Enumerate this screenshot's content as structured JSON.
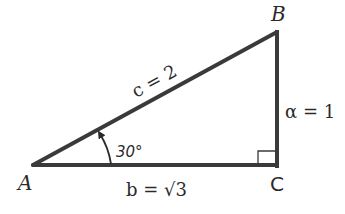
{
  "diagram": {
    "colors": {
      "stroke": "#3a3a3a",
      "text": "#2a2a2a",
      "background": "#ffffff"
    },
    "vertices": {
      "A": {
        "label": "A",
        "x": 33,
        "y": 165
      },
      "B": {
        "label": "B",
        "x": 277,
        "y": 32
      },
      "C": {
        "label": "C",
        "x": 277,
        "y": 165
      }
    },
    "sides": {
      "c": {
        "label": "c = 2",
        "name": "hypotenuse"
      },
      "a": {
        "label": "α = 1",
        "name": "opposite"
      },
      "b": {
        "label": "b = √3",
        "name": "adjacent"
      }
    },
    "angle_A": {
      "label": "30°"
    },
    "right_angle_at": "C"
  }
}
